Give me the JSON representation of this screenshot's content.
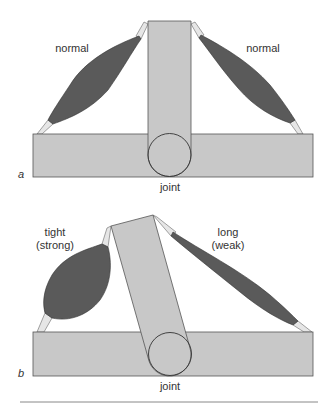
{
  "panels": [
    {
      "letter": "a",
      "left_muscle_label": "normal",
      "right_muscle_label": "normal",
      "joint_label": "joint"
    },
    {
      "letter": "b",
      "left_muscle_label_line1": "tight",
      "left_muscle_label_line2": "(strong)",
      "right_muscle_label_line1": "long",
      "right_muscle_label_line2": "(weak)",
      "joint_label": "joint"
    }
  ],
  "colors": {
    "bone": "#c8c8c8",
    "muscle": "#5a5a5a",
    "tendon": "#e6e6e6",
    "outline": "#444444"
  }
}
